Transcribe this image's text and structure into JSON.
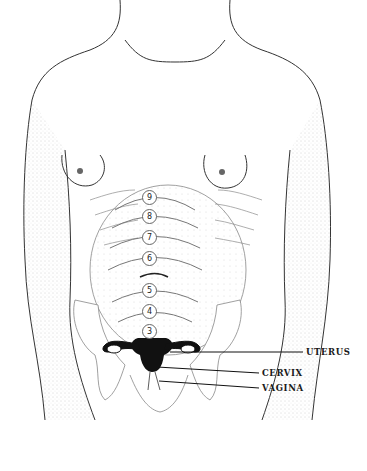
{
  "figure": {
    "fundal_markers": [
      {
        "label": "9",
        "x": 148,
        "y": 197
      },
      {
        "label": "8",
        "x": 148,
        "y": 216
      },
      {
        "label": "7",
        "x": 148,
        "y": 237
      },
      {
        "label": "6",
        "x": 148,
        "y": 258
      },
      {
        "label": "5",
        "x": 148,
        "y": 290
      },
      {
        "label": "4",
        "x": 148,
        "y": 311
      },
      {
        "label": "3",
        "x": 148,
        "y": 331
      }
    ],
    "labels": {
      "uterus": "UTERUS",
      "cervix": "CERVIX",
      "vagina": "VAGINA"
    },
    "colors": {
      "ink": "#1a1a1a",
      "background": "#ffffff",
      "stipple": "#9a9a9a"
    }
  }
}
